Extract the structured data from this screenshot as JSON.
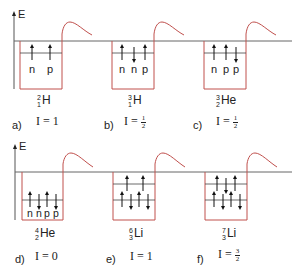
{
  "figure": {
    "axis_label": "E",
    "colors": {
      "well": "#c0504d",
      "line": "#555555",
      "arrow": "#111111"
    },
    "panels": [
      {
        "id": "a",
        "tag": "a)",
        "mass": "2",
        "charge": "1",
        "element": "H",
        "spin_text": "I = 1",
        "spin_whole": "1",
        "particles": [
          "n",
          "p"
        ],
        "levels": [
          {
            "spins": [
              "up",
              "up"
            ]
          }
        ]
      },
      {
        "id": "b",
        "tag": "b)",
        "mass": "3",
        "charge": "1",
        "element": "H",
        "spin_text": "I = 1/2",
        "spin_num": "1",
        "spin_den": "2",
        "particles": [
          "n",
          "n",
          "p"
        ],
        "levels": [
          {
            "spins": [
              "up",
              "down",
              "up"
            ]
          }
        ]
      },
      {
        "id": "c",
        "tag": "c)",
        "mass": "3",
        "charge": "2",
        "element": "He",
        "spin_text": "I = 1/2",
        "spin_num": "1",
        "spin_den": "2",
        "particles": [
          "n",
          "p",
          "p"
        ],
        "levels": [
          {
            "spins": [
              "up",
              "up",
              "down"
            ]
          }
        ]
      },
      {
        "id": "d",
        "tag": "d)",
        "mass": "4",
        "charge": "2",
        "element": "He",
        "spin_text": "I = 0",
        "spin_whole": "0",
        "particles": [
          "n",
          "n",
          "p",
          "p"
        ],
        "levels": [
          {
            "spins": [
              "up",
              "down",
              "up",
              "down"
            ]
          }
        ]
      },
      {
        "id": "e",
        "tag": "e)",
        "mass": "6",
        "charge": "3",
        "element": "Li",
        "spin_text": "I = 1",
        "spin_whole": "1",
        "particles": [],
        "levels": [
          {
            "spins": [
              "up",
              "down",
              "up",
              "down"
            ]
          },
          {
            "spins": [
              "up",
              "up"
            ]
          }
        ]
      },
      {
        "id": "f",
        "tag": "f)",
        "mass": "7",
        "charge": "3",
        "element": "Li",
        "spin_text": "I = 3/2",
        "spin_num": "3",
        "spin_den": "2",
        "particles": [],
        "levels": [
          {
            "spins": [
              "up",
              "down",
              "up",
              "down"
            ]
          },
          {
            "spins": [
              "up",
              "down",
              "up"
            ]
          }
        ]
      }
    ]
  }
}
